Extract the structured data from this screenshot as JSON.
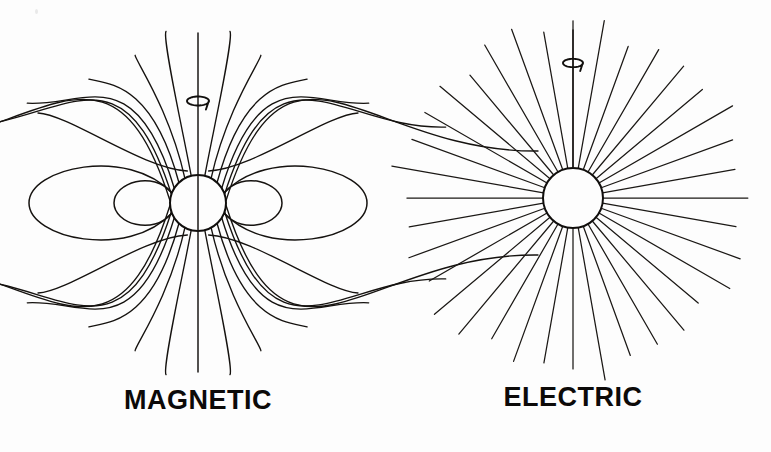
{
  "figure": {
    "kind": "physics-field-diagram",
    "background_color": "#fdfdfd",
    "stroke_color": "#15120f",
    "width": 771,
    "height": 452,
    "panels": [
      {
        "id": "magnetic",
        "label": "MAGNETIC",
        "label_x": 198,
        "label_y": 409,
        "center_x": 198,
        "center_y": 203,
        "sphere_radius": 28,
        "axis": {
          "name": "rotation-axis",
          "x": 198,
          "y_top": 33,
          "y_bottom": 372,
          "spin_marker_y": 101,
          "spin_marker_rx": 11,
          "spin_marker_ry": 4.5
        },
        "closed_loops": [
          {
            "side": "left",
            "span": 141,
            "height": 57
          },
          {
            "side": "right",
            "span": 141,
            "height": 57
          },
          {
            "side": "left",
            "span": 56,
            "height": 33
          },
          {
            "side": "right",
            "span": 56,
            "height": 33
          }
        ],
        "open_line_angles_deg": [
          14,
          28,
          43,
          58,
          72,
          86
        ],
        "open_line_count": 24
      },
      {
        "id": "electric",
        "label": "ELECTRIC",
        "label_x": 573,
        "label_y": 406,
        "center_x": 573,
        "center_y": 198,
        "sphere_radius": 30,
        "axis": {
          "name": "rotation-axis",
          "x": 573,
          "y_top": 30,
          "y_bottom": 168,
          "spin_marker_y": 63,
          "spin_marker_rx": 10,
          "spin_marker_ry": 4.2
        },
        "ray_count": 36,
        "ray_inner_radius": 30,
        "ray_outer_radius": 172
      }
    ]
  },
  "labels": {
    "magnetic": "MAGNETIC",
    "electric": "ELECTRIC"
  }
}
